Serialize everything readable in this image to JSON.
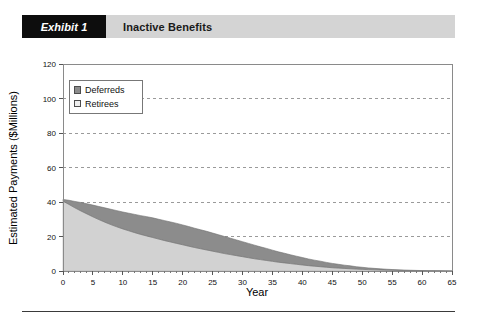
{
  "exhibit": {
    "tag": "Exhibit 1",
    "title": "Inactive Benefits"
  },
  "chart_data": {
    "type": "area",
    "stacked": true,
    "title": "Inactive Benefits",
    "xlabel": "Year",
    "ylabel": "Estimated Payments ($Millions)",
    "xlim": [
      0,
      65
    ],
    "ylim": [
      0,
      120
    ],
    "xticks": [
      0,
      5,
      10,
      15,
      20,
      25,
      30,
      35,
      40,
      45,
      50,
      55,
      60,
      65
    ],
    "yticks": [
      0,
      20,
      40,
      60,
      80,
      100,
      120
    ],
    "xtick_labels": [
      "0",
      "5",
      "10",
      "15",
      "20",
      "25",
      "30",
      "35",
      "40",
      "45",
      "50",
      "55",
      "60",
      "65"
    ],
    "ytick_labels": [
      "0",
      "20",
      "40",
      "60",
      "80",
      "100",
      "120"
    ],
    "grid": "horizontal-dashed",
    "legend_position": "top-left",
    "x": [
      0,
      1,
      2,
      3,
      4,
      5,
      6,
      7,
      8,
      9,
      10,
      11,
      12,
      13,
      14,
      15,
      16,
      17,
      18,
      19,
      20,
      21,
      22,
      23,
      24,
      25,
      26,
      27,
      28,
      29,
      30,
      31,
      32,
      33,
      34,
      35,
      36,
      37,
      38,
      39,
      40,
      41,
      42,
      43,
      44,
      45,
      46,
      47,
      48,
      49,
      50,
      51,
      52,
      53,
      54,
      55,
      56,
      57,
      58,
      59,
      60,
      61,
      62,
      63,
      64,
      65
    ],
    "series": [
      {
        "name": "Retirees",
        "color": "#d2d2d2",
        "values": [
          40.5,
          38.6,
          36.6,
          34.8,
          33.1,
          31.4,
          29.8,
          28.3,
          26.9,
          25.6,
          24.4,
          23.3,
          22.2,
          21.2,
          20.3,
          19.4,
          18.5,
          17.6,
          16.8,
          16.0,
          15.2,
          14.4,
          13.6,
          12.9,
          12.2,
          11.5,
          10.8,
          10.1,
          9.5,
          8.9,
          8.3,
          7.7,
          7.1,
          6.6,
          6.1,
          5.6,
          5.1,
          4.7,
          4.3,
          3.9,
          3.5,
          3.1,
          2.8,
          2.5,
          2.2,
          1.9,
          1.7,
          1.5,
          1.3,
          1.1,
          0.95,
          0.8,
          0.68,
          0.57,
          0.47,
          0.39,
          0.32,
          0.26,
          0.21,
          0.16,
          0.12,
          0.09,
          0.07,
          0.05,
          0.03,
          0.0
        ]
      },
      {
        "name": "Deferreds",
        "color": "#8c8c8c",
        "values": [
          1.0,
          2.4,
          3.7,
          4.9,
          5.9,
          6.8,
          7.6,
          8.3,
          8.9,
          9.4,
          9.8,
          10.2,
          10.6,
          10.9,
          11.2,
          11.4,
          11.5,
          11.6,
          11.6,
          11.6,
          11.5,
          11.4,
          11.2,
          11.0,
          10.8,
          10.5,
          10.2,
          9.9,
          9.5,
          9.1,
          8.7,
          8.3,
          7.9,
          7.4,
          7.0,
          6.5,
          6.0,
          5.6,
          5.1,
          4.7,
          4.3,
          3.9,
          3.5,
          3.2,
          2.8,
          2.5,
          2.2,
          1.9,
          1.7,
          1.4,
          1.2,
          1.0,
          0.85,
          0.7,
          0.58,
          0.47,
          0.38,
          0.3,
          0.24,
          0.18,
          0.14,
          0.1,
          0.07,
          0.05,
          0.03,
          0.0
        ]
      }
    ],
    "legend": [
      {
        "label": "Deferreds",
        "color": "#8c8c8c"
      },
      {
        "label": "Retirees",
        "color": "#efefef"
      }
    ]
  }
}
